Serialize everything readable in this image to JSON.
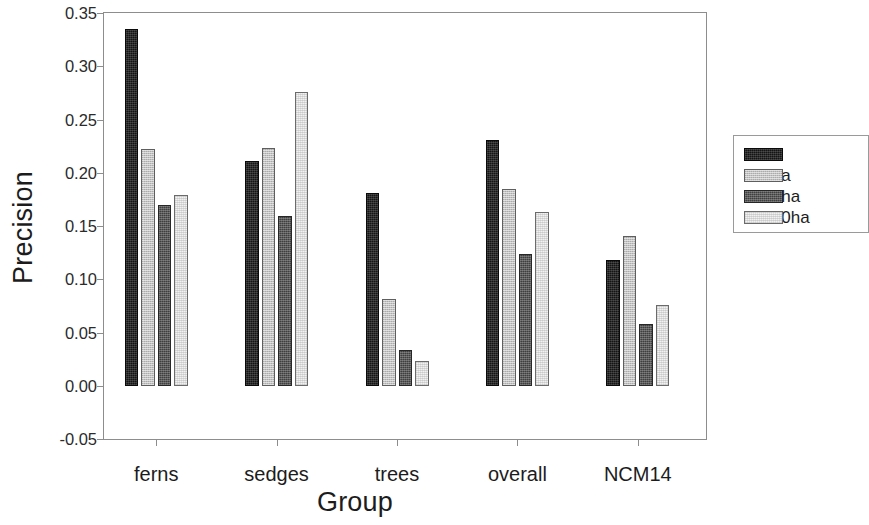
{
  "chart_data": {
    "type": "bar",
    "title": "",
    "xlabel": "Group",
    "ylabel": "Precision",
    "categories": [
      "ferns",
      "sedges",
      "trees",
      "overall",
      "NCM14"
    ],
    "series": [
      {
        "name": "4ha",
        "color": "#141414",
        "values": [
          0.335,
          0.211,
          0.181,
          0.231,
          0.118
        ]
      },
      {
        "name": "25ha",
        "color": "#c2c2c2",
        "values": [
          0.222,
          0.223,
          0.081,
          0.185,
          0.141
        ]
      },
      {
        "name": "240ha",
        "color": "#3f3f3f",
        "values": [
          0.17,
          0.159,
          0.034,
          0.124,
          0.058
        ]
      },
      {
        "name": "1040ha",
        "color": "#f2f2f2",
        "values": [
          0.179,
          0.276,
          0.023,
          0.163,
          0.076
        ]
      }
    ],
    "ylim": [
      -0.05,
      0.35
    ],
    "ytick_labels": [
      "0.35",
      "0.30",
      "0.25",
      "0.20",
      "0.15",
      "0.10",
      "0.05",
      "0.00",
      "-0.05"
    ],
    "ytick_values": [
      0.35,
      0.3,
      0.25,
      0.2,
      0.15,
      0.1,
      0.05,
      0.0,
      -0.05
    ],
    "grid": false,
    "legend_position": "right",
    "legend_entries": [
      "4ha",
      "25ha",
      "240ha",
      "1040ha"
    ]
  }
}
